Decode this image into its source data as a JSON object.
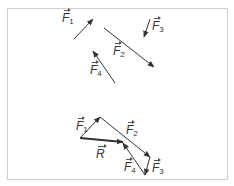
{
  "diagram": {
    "colors": {
      "frame": "#cfcfcf",
      "arrow": "#333333",
      "text": "#333333"
    },
    "separate_forces": [
      {
        "id": "F1",
        "symbol": "F",
        "sub": "1",
        "tail": [
          74,
          39
        ],
        "head": [
          93,
          19
        ],
        "label_pos": [
          62,
          12
        ]
      },
      {
        "id": "F2",
        "symbol": "F",
        "sub": "2",
        "tail": [
          104,
          28
        ],
        "head": [
          154,
          67
        ],
        "label_pos": [
          113,
          45
        ]
      },
      {
        "id": "F3",
        "symbol": "F",
        "sub": "3",
        "tail": [
          150,
          19
        ],
        "head": [
          144,
          37
        ],
        "label_pos": [
          152,
          20
        ]
      },
      {
        "id": "F4",
        "symbol": "F",
        "sub": "4",
        "tail": [
          115,
          83
        ],
        "head": [
          93,
          51
        ],
        "label_pos": [
          90,
          64
        ]
      }
    ],
    "polygon": [
      {
        "id": "F1",
        "symbol": "F",
        "sub": "1",
        "tail": [
          80,
          138
        ],
        "head": [
          100,
          117
        ],
        "label_pos": [
          76,
          120
        ]
      },
      {
        "id": "F2",
        "symbol": "F",
        "sub": "2",
        "tail": [
          100,
          117
        ],
        "head": [
          150,
          157
        ],
        "label_pos": [
          126,
          124
        ]
      },
      {
        "id": "F3",
        "symbol": "F",
        "sub": "3",
        "tail": [
          150,
          157
        ],
        "head": [
          145,
          175
        ],
        "label_pos": [
          152,
          162
        ]
      },
      {
        "id": "F4",
        "symbol": "F",
        "sub": "4",
        "tail": [
          145,
          175
        ],
        "head": [
          123,
          143
        ],
        "label_pos": [
          124,
          161
        ]
      }
    ],
    "resultant": {
      "id": "R",
      "symbol": "R",
      "sub": "",
      "tail": [
        80,
        138
      ],
      "head": [
        123,
        142
      ],
      "label_pos": [
        96,
        148
      ]
    }
  }
}
